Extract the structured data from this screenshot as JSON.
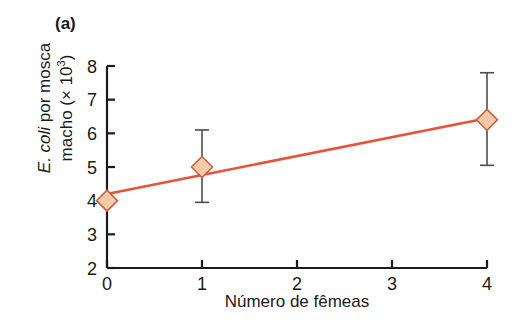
{
  "figure": {
    "panel_label": "(a)",
    "background_color": "#ffffff"
  },
  "chart_data": {
    "type": "scatter",
    "title": "",
    "subtitle": "",
    "panel": "(a)",
    "xlabel": "Número de fêmeas",
    "ylabel_line1_prefix": "E. coli",
    "ylabel_line1_rest": " por mosca",
    "ylabel_line2_prefix": "macho (× 10",
    "ylabel_line2_sup": "3",
    "ylabel_line2_suffix": ")",
    "ylabel_full": "E. coli por mosca macho (× 10³)",
    "xlim": [
      0,
      4
    ],
    "ylim": [
      2,
      8
    ],
    "xticks": [
      0,
      1,
      2,
      3,
      4
    ],
    "xtick_labels": [
      "0",
      "1",
      "2",
      "3",
      "4"
    ],
    "yticks": [
      2,
      3,
      4,
      5,
      6,
      7,
      8
    ],
    "ytick_labels": [
      "2",
      "3",
      "4",
      "5",
      "6",
      "7",
      "8"
    ],
    "grid": false,
    "legend": null,
    "tick_direction": "in",
    "axis_spines": [
      "left",
      "bottom"
    ],
    "x": [
      0,
      1,
      4
    ],
    "y": [
      4.0,
      5.0,
      6.4
    ],
    "error_low": [
      null,
      3.95,
      5.05
    ],
    "error_high": [
      null,
      6.1,
      7.8
    ],
    "points": [
      {
        "x": 0,
        "y": 4.0,
        "err_low": null,
        "err_high": null
      },
      {
        "x": 1,
        "y": 5.0,
        "err_low": 3.95,
        "err_high": 6.1
      },
      {
        "x": 4,
        "y": 6.4,
        "err_low": 5.05,
        "err_high": 7.8
      }
    ],
    "trendline": {
      "type": "line",
      "x": [
        0,
        4
      ],
      "y": [
        4.2,
        6.45
      ],
      "color": "#e8513a"
    },
    "marker": {
      "shape": "diamond",
      "fill_color": "#f6c9a6",
      "edge_color": "#c0664a"
    },
    "errorbar_color": "#4d4d4d",
    "axis_color": "#1a1a1a"
  }
}
